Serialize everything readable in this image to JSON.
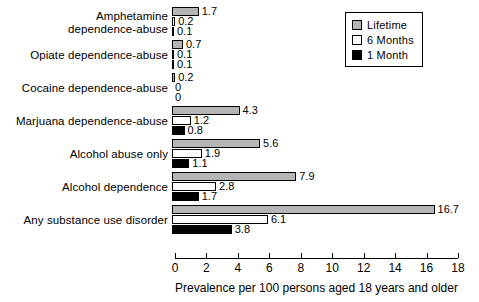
{
  "chart_data": {
    "type": "bar",
    "orientation": "horizontal",
    "title": "",
    "xlabel": "Prevalence per 100 persons aged 18 years and older",
    "ylabel": "",
    "xlim": [
      0,
      18
    ],
    "xticks": [
      0,
      2,
      4,
      6,
      8,
      10,
      12,
      14,
      16,
      18
    ],
    "grid": false,
    "legend_position": "top-right",
    "categories": [
      "Amphetamine dependence-abuse",
      "Opiate dependence-abuse",
      "Cocaine dependence-abuse",
      "Marjuana dependence-abuse",
      "Alcohol abuse only",
      "Alcohol dependence",
      "Any substance use disorder"
    ],
    "series": [
      {
        "name": "Lifetime",
        "color": "#b5b5b5",
        "values": [
          1.7,
          0.7,
          0.2,
          4.3,
          5.6,
          7.9,
          16.7
        ]
      },
      {
        "name": "6 Months",
        "color": "#ffffff",
        "values": [
          0.2,
          0.1,
          0.0,
          1.2,
          1.9,
          2.8,
          6.1
        ]
      },
      {
        "name": "1 Month",
        "color": "#000000",
        "values": [
          0.1,
          0.1,
          0.0,
          0.8,
          1.1,
          1.7,
          3.8
        ]
      }
    ],
    "value_labels": [
      [
        "1.7",
        "0.2",
        "0.1"
      ],
      [
        "0.7",
        "0.1",
        "0.1"
      ],
      [
        "0.2",
        "0",
        "0"
      ],
      [
        "4.3",
        "1.2",
        "0.8"
      ],
      [
        "5.6",
        "1.9",
        "1.1"
      ],
      [
        "7.9",
        "2.8",
        "1.7"
      ],
      [
        "16.7",
        "6.1",
        "3.8"
      ]
    ]
  },
  "legend": {
    "items": [
      {
        "label": "Lifetime",
        "swatch": "gray-swatch-icon"
      },
      {
        "label": "6 Months",
        "swatch": "white-swatch-icon"
      },
      {
        "label": "1 Month",
        "swatch": "black-swatch-icon"
      }
    ]
  },
  "axis": {
    "title": "Prevalence per 100 persons aged 18 years and older",
    "ticks": [
      "0",
      "2",
      "4",
      "6",
      "8",
      "10",
      "12",
      "14",
      "16",
      "18"
    ]
  },
  "categories_display": [
    {
      "line1": "Amphetamine",
      "line2": "dependence-abuse"
    },
    {
      "line1": "Opiate dependence-abuse",
      "line2": ""
    },
    {
      "line1": "Cocaine dependence-abuse",
      "line2": ""
    },
    {
      "line1": "Marjuana dependence-abuse",
      "line2": ""
    },
    {
      "line1": "Alcohol abuse only",
      "line2": ""
    },
    {
      "line1": "Alcohol dependence",
      "line2": ""
    },
    {
      "line1": "Any substance use disorder",
      "line2": ""
    }
  ]
}
